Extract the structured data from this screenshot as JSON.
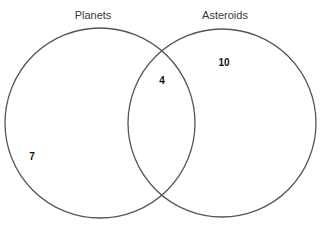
{
  "diagram": {
    "type": "venn",
    "sets": [
      {
        "label": "Planets",
        "cx": 100,
        "cy": 123,
        "r": 95
      },
      {
        "label": "Asteroids",
        "cx": 222,
        "cy": 123,
        "r": 94
      }
    ],
    "regions": {
      "planets_only": "7",
      "both": "4",
      "asteroids_only": "10"
    },
    "stroke_color": "#555555"
  }
}
